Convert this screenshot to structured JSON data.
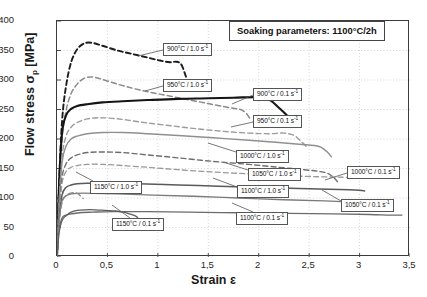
{
  "chart_data": {
    "type": "line",
    "title": "Soaking parameters:  1100°C/2h",
    "xlabel": "Strain ε",
    "ylabel": "Flow stress σp [MPa]",
    "ylabel_main": "Flow stress",
    "ylabel_symbol": "σ",
    "ylabel_subscript": "p",
    "ylabel_unit": "[MPa]",
    "xlim": [
      0,
      3.5
    ],
    "ylim": [
      0,
      400
    ],
    "xticks": [
      "0",
      "0,5",
      "1",
      "1,5",
      "2",
      "2,5",
      "3",
      "3,5"
    ],
    "xtick_values": [
      0,
      0.5,
      1,
      1.5,
      2,
      2.5,
      3,
      3.5
    ],
    "yticks": [
      "0",
      "50",
      "100",
      "150",
      "200",
      "250",
      "300",
      "350",
      "400"
    ],
    "ytick_values": [
      0,
      50,
      100,
      150,
      200,
      250,
      300,
      350,
      400
    ],
    "grid": "dotted-both",
    "legend_position": "inline-callouts",
    "series": [
      {
        "name": "900°C / 1.0 s",
        "label": "900°C / 1.0 s",
        "exponent": "-1",
        "style": "dashed",
        "color": "#1c1c1c",
        "width": 1.9,
        "points": [
          [
            0,
            0
          ],
          [
            0.02,
            120
          ],
          [
            0.05,
            230
          ],
          [
            0.09,
            290
          ],
          [
            0.14,
            330
          ],
          [
            0.2,
            352
          ],
          [
            0.27,
            362
          ],
          [
            0.35,
            363
          ],
          [
            0.45,
            358
          ],
          [
            0.6,
            350
          ],
          [
            0.75,
            344
          ],
          [
            0.9,
            338
          ],
          [
            1.02,
            333
          ],
          [
            1.12,
            330
          ],
          [
            1.18,
            331
          ],
          [
            1.23,
            327
          ],
          [
            1.27,
            310
          ],
          [
            1.3,
            295
          ]
        ]
      },
      {
        "name": "950°C / 1.0 s",
        "label": "950°C / 1.0 s",
        "exponent": "-1",
        "style": "dashed",
        "color": "#8a8a8a",
        "width": 1.5,
        "points": [
          [
            0,
            0
          ],
          [
            0.02,
            105
          ],
          [
            0.05,
            200
          ],
          [
            0.09,
            248
          ],
          [
            0.14,
            277
          ],
          [
            0.2,
            293
          ],
          [
            0.27,
            303
          ],
          [
            0.35,
            305
          ],
          [
            0.45,
            301
          ],
          [
            0.6,
            293
          ],
          [
            0.75,
            286
          ],
          [
            0.9,
            280
          ],
          [
            1.05,
            275
          ],
          [
            1.2,
            270
          ],
          [
            1.35,
            265
          ],
          [
            1.5,
            260
          ],
          [
            1.65,
            255
          ],
          [
            1.75,
            252
          ],
          [
            1.82,
            250
          ],
          [
            1.88,
            243
          ],
          [
            1.92,
            232
          ]
        ]
      },
      {
        "name": "900°C / 0.1 s",
        "label": "900°C / 0.1 s",
        "exponent": "-1",
        "style": "solid",
        "color": "#151515",
        "width": 2.1,
        "points": [
          [
            0,
            0
          ],
          [
            0.02,
            120
          ],
          [
            0.05,
            210
          ],
          [
            0.09,
            240
          ],
          [
            0.14,
            251
          ],
          [
            0.2,
            256
          ],
          [
            0.3,
            259
          ],
          [
            0.45,
            262
          ],
          [
            0.65,
            264
          ],
          [
            0.9,
            266
          ],
          [
            1.2,
            268
          ],
          [
            1.5,
            269
          ],
          [
            1.75,
            270
          ],
          [
            1.95,
            271
          ],
          [
            2.05,
            270
          ],
          [
            2.12,
            265
          ],
          [
            2.2,
            253
          ],
          [
            2.28,
            240
          ],
          [
            2.34,
            228
          ]
        ]
      },
      {
        "name": "950°C / 0.1 s",
        "label": "950°C / 0.1 s",
        "exponent": "-1",
        "style": "dashed",
        "color": "#9c9c9c",
        "width": 1.4,
        "points": [
          [
            0,
            0
          ],
          [
            0.02,
            90
          ],
          [
            0.05,
            170
          ],
          [
            0.09,
            205
          ],
          [
            0.14,
            220
          ],
          [
            0.2,
            228
          ],
          [
            0.3,
            234
          ],
          [
            0.42,
            236
          ],
          [
            0.55,
            235
          ],
          [
            0.7,
            232
          ],
          [
            0.9,
            227
          ],
          [
            1.15,
            222
          ],
          [
            1.4,
            217
          ],
          [
            1.65,
            213
          ],
          [
            1.9,
            210
          ],
          [
            2.1,
            209
          ],
          [
            2.25,
            210
          ],
          [
            2.35,
            206
          ],
          [
            2.42,
            196
          ],
          [
            2.48,
            186
          ]
        ]
      },
      {
        "name": "1000°C / 1.0 s",
        "label": "1000°C / 1.0 s",
        "exponent": "-1",
        "style": "solid",
        "color": "#8f8f8f",
        "width": 1.4,
        "points": [
          [
            0,
            0
          ],
          [
            0.02,
            85
          ],
          [
            0.05,
            160
          ],
          [
            0.09,
            188
          ],
          [
            0.14,
            200
          ],
          [
            0.2,
            205
          ],
          [
            0.3,
            209
          ],
          [
            0.45,
            211
          ],
          [
            0.65,
            211
          ],
          [
            0.9,
            209
          ],
          [
            1.2,
            206
          ],
          [
            1.55,
            202
          ],
          [
            1.9,
            198
          ],
          [
            2.2,
            194
          ],
          [
            2.4,
            191
          ],
          [
            2.55,
            189
          ],
          [
            2.62,
            186
          ],
          [
            2.68,
            178
          ],
          [
            2.72,
            170
          ]
        ]
      },
      {
        "name": "1050°C / 1.0 s",
        "label": "1050°C / 1.0 s",
        "exponent": "-1",
        "style": "dashed",
        "color": "#6e6e6e",
        "width": 1.4,
        "points": [
          [
            0,
            0
          ],
          [
            0.02,
            75
          ],
          [
            0.05,
            135
          ],
          [
            0.09,
            158
          ],
          [
            0.14,
            168
          ],
          [
            0.2,
            173
          ],
          [
            0.3,
            177
          ],
          [
            0.45,
            178
          ],
          [
            0.65,
            177
          ],
          [
            0.9,
            173
          ],
          [
            1.2,
            168
          ],
          [
            1.55,
            162
          ],
          [
            1.9,
            157
          ],
          [
            2.2,
            152
          ],
          [
            2.45,
            148
          ],
          [
            2.6,
            145
          ],
          [
            2.68,
            142
          ],
          [
            2.74,
            135
          ],
          [
            2.78,
            128
          ]
        ]
      },
      {
        "name": "1000°C / 0.1 s",
        "label": "1000°C / 0.1 s",
        "exponent": "-1",
        "style": "dashed",
        "color": "#9a9a9a",
        "width": 1.3,
        "points": [
          [
            0,
            0
          ],
          [
            0.02,
            70
          ],
          [
            0.05,
            125
          ],
          [
            0.09,
            145
          ],
          [
            0.14,
            152
          ],
          [
            0.2,
            155
          ],
          [
            0.3,
            157
          ],
          [
            0.45,
            157
          ],
          [
            0.65,
            155
          ],
          [
            0.9,
            152
          ],
          [
            1.2,
            148
          ],
          [
            1.55,
            144
          ],
          [
            1.9,
            141
          ],
          [
            2.25,
            138
          ],
          [
            2.6,
            136
          ],
          [
            2.9,
            135
          ],
          [
            3.05,
            135
          ],
          [
            3.15,
            134
          ]
        ]
      },
      {
        "name": "1100°C / 1.0 s",
        "label": "1100°C / 1.0 s",
        "exponent": "-1",
        "style": "solid",
        "color": "#5a5a5a",
        "width": 1.5,
        "points": [
          [
            0,
            0
          ],
          [
            0.02,
            62
          ],
          [
            0.05,
            105
          ],
          [
            0.09,
            118
          ],
          [
            0.14,
            122
          ],
          [
            0.2,
            124
          ],
          [
            0.3,
            125
          ],
          [
            0.5,
            125
          ],
          [
            0.8,
            124
          ],
          [
            1.2,
            122
          ],
          [
            1.6,
            120
          ],
          [
            2.0,
            118
          ],
          [
            2.4,
            116
          ],
          [
            2.7,
            115
          ],
          [
            2.9,
            114
          ],
          [
            3.0,
            113
          ],
          [
            3.05,
            112
          ]
        ]
      },
      {
        "name": "1050°C / 0.1 s",
        "label": "1050°C / 0.1 s",
        "exponent": "-1",
        "style": "solid",
        "color": "#7a7a7a",
        "width": 1.3,
        "points": [
          [
            0,
            0
          ],
          [
            0.02,
            58
          ],
          [
            0.05,
            95
          ],
          [
            0.09,
            104
          ],
          [
            0.14,
            107
          ],
          [
            0.2,
            108
          ],
          [
            0.35,
            108
          ],
          [
            0.6,
            107
          ],
          [
            0.95,
            105
          ],
          [
            1.35,
            103
          ],
          [
            1.8,
            100
          ],
          [
            2.25,
            97
          ],
          [
            2.65,
            95
          ],
          [
            2.95,
            93
          ],
          [
            3.1,
            92
          ],
          [
            3.18,
            91
          ]
        ]
      },
      {
        "name": "1100°C / 0.1 s",
        "label": "1100°C / 0.1 s",
        "exponent": "-1",
        "style": "solid",
        "color": "#6b6b6b",
        "width": 1.3,
        "points": [
          [
            0,
            0
          ],
          [
            0.02,
            45
          ],
          [
            0.05,
            66
          ],
          [
            0.09,
            71
          ],
          [
            0.14,
            73
          ],
          [
            0.22,
            75
          ],
          [
            0.35,
            76
          ],
          [
            0.55,
            77
          ],
          [
            0.9,
            77
          ],
          [
            1.3,
            76
          ],
          [
            1.8,
            75
          ],
          [
            2.3,
            74
          ],
          [
            2.75,
            73
          ],
          [
            3.1,
            72
          ],
          [
            3.3,
            71
          ],
          [
            3.42,
            71
          ]
        ]
      },
      {
        "name": "1150°C / 1.0 s",
        "label": "1150°C / 1.0 s",
        "exponent": "-1",
        "style": "dashed",
        "color": "#888888",
        "width": 1.3,
        "points": [
          [
            0,
            0
          ],
          [
            0.02,
            55
          ],
          [
            0.05,
            92
          ],
          [
            0.09,
            104
          ],
          [
            0.13,
            108
          ],
          [
            0.17,
            109
          ],
          [
            0.2,
            108
          ],
          [
            0.23,
            104
          ],
          [
            0.26,
            99
          ]
        ]
      },
      {
        "name": "1150°C / 0.1 s",
        "label": "1150°C / 0.1 s",
        "exponent": "-1",
        "style": "solid",
        "color": "#5f5f5f",
        "width": 1.3,
        "points": [
          [
            0,
            0
          ],
          [
            0.02,
            40
          ],
          [
            0.05,
            62
          ],
          [
            0.09,
            70
          ],
          [
            0.14,
            76
          ],
          [
            0.2,
            79
          ],
          [
            0.28,
            80
          ],
          [
            0.38,
            80
          ],
          [
            0.48,
            79
          ],
          [
            0.58,
            78
          ],
          [
            0.66,
            76
          ],
          [
            0.72,
            73
          ],
          [
            0.77,
            70
          ],
          [
            0.8,
            67
          ]
        ]
      }
    ],
    "callouts": [
      {
        "key": "c900_10",
        "label": "900°C / 1.0 s",
        "exponent": "-1"
      },
      {
        "key": "c950_10",
        "label": "950°C / 1.0 s",
        "exponent": "-1"
      },
      {
        "key": "c900_01",
        "label": "900°C / 0.1 s",
        "exponent": "-1"
      },
      {
        "key": "c950_01",
        "label": "950°C / 0.1 s",
        "exponent": "-1"
      },
      {
        "key": "c1000_10",
        "label": "1000°C / 1.0 s",
        "exponent": "-1"
      },
      {
        "key": "c1050_10",
        "label": "1050°C / 1.0 s",
        "exponent": "-1"
      },
      {
        "key": "c1000_01",
        "label": "1000°C / 0.1 s",
        "exponent": "-1"
      },
      {
        "key": "c1100_10",
        "label": "1100°C / 1.0 s",
        "exponent": "-1"
      },
      {
        "key": "c1050_01",
        "label": "1050°C / 0.1 s",
        "exponent": "-1"
      },
      {
        "key": "c1100_01",
        "label": "1100°C / 0.1 s",
        "exponent": "-1"
      },
      {
        "key": "c1150_10",
        "label": "1150°C / 1.0 s",
        "exponent": "-1"
      },
      {
        "key": "c1150_01",
        "label": "1150°C / 0.1 s",
        "exponent": "-1"
      }
    ]
  }
}
